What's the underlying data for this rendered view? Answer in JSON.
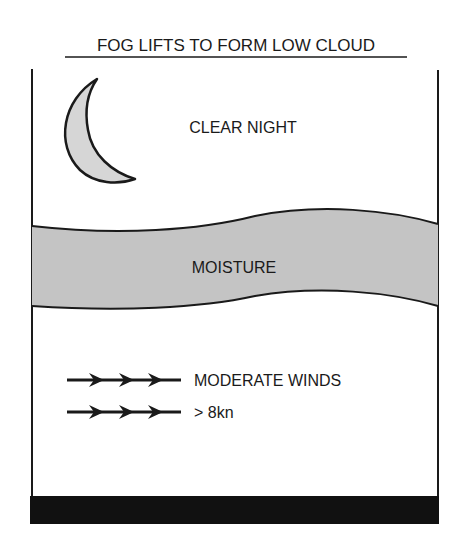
{
  "title": "FOG LIFTS TO FORM LOW CLOUD",
  "labels": {
    "sky": "CLEAR NIGHT",
    "band": "MOISTURE",
    "winds_line1": "MODERATE WINDS",
    "winds_line2": "> 8kn"
  },
  "icons": {
    "moon": "crescent-moon-icon",
    "wind": "wind-arrow-icon"
  },
  "colors": {
    "ink": "#1a1a1a",
    "moon_fill": "#d6d6d6",
    "moisture_fill": "#c4c4c4",
    "ground_fill": "#111111",
    "background": "#ffffff"
  },
  "wind_arrows": {
    "rows": 2,
    "arrowheads_per_row": 3
  }
}
